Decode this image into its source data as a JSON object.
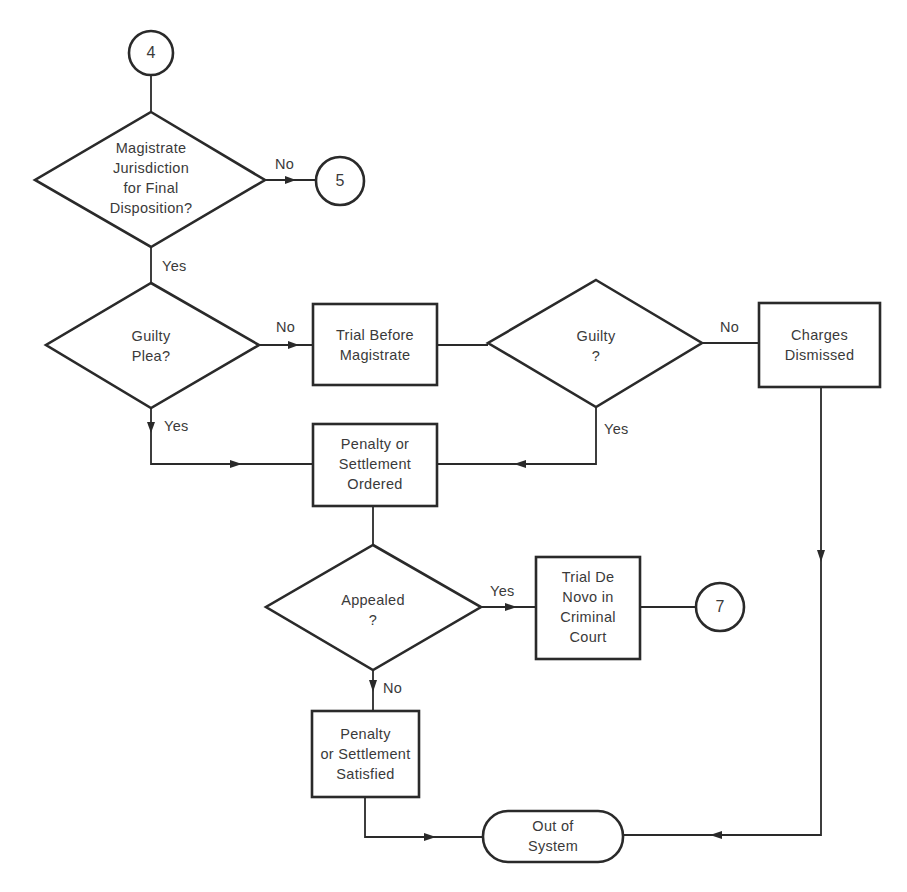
{
  "diagram": {
    "type": "flowchart",
    "connectors": {
      "entry": "4",
      "exit_no_jurisdiction": "5",
      "exit_trial_de_novo": "7"
    },
    "nodes": {
      "jurisdiction": "Magistrate\nJurisdiction\nfor Final\nDisposition?",
      "guilty_plea": "Guilty\nPlea?",
      "trial_before_magistrate": "Trial Before\nMagistrate",
      "guilty": "Guilty\n?",
      "charges_dismissed": "Charges\nDismissed",
      "penalty_ordered": "Penalty or\nSettlement\nOrdered",
      "appealed": "Appealed\n?",
      "trial_de_novo": "Trial De\nNovo in\nCriminal\nCourt",
      "penalty_satisfied": "Penalty\nor Settlement\nSatisfied",
      "out_of_system": "Out of\nSystem"
    },
    "edge_labels": {
      "jurisdiction_no": "No",
      "jurisdiction_yes": "Yes",
      "plea_no": "No",
      "plea_yes": "Yes",
      "guilty_no": "No",
      "guilty_yes": "Yes",
      "appealed_yes": "Yes",
      "appealed_no": "No"
    },
    "edges": [
      {
        "from": "4",
        "to": "jurisdiction"
      },
      {
        "from": "jurisdiction",
        "to": "5",
        "label": "No"
      },
      {
        "from": "jurisdiction",
        "to": "guilty_plea",
        "label": "Yes"
      },
      {
        "from": "guilty_plea",
        "to": "trial_before_magistrate",
        "label": "No"
      },
      {
        "from": "guilty_plea",
        "to": "penalty_ordered",
        "label": "Yes"
      },
      {
        "from": "trial_before_magistrate",
        "to": "guilty"
      },
      {
        "from": "guilty",
        "to": "charges_dismissed",
        "label": "No"
      },
      {
        "from": "guilty",
        "to": "penalty_ordered",
        "label": "Yes"
      },
      {
        "from": "penalty_ordered",
        "to": "appealed"
      },
      {
        "from": "appealed",
        "to": "trial_de_novo",
        "label": "Yes"
      },
      {
        "from": "trial_de_novo",
        "to": "7"
      },
      {
        "from": "appealed",
        "to": "penalty_satisfied",
        "label": "No"
      },
      {
        "from": "penalty_satisfied",
        "to": "out_of_system"
      },
      {
        "from": "charges_dismissed",
        "to": "out_of_system"
      }
    ],
    "colors": {
      "stroke": "#2a2a2a",
      "text": "#3a3a3a",
      "background": "#ffffff"
    }
  }
}
